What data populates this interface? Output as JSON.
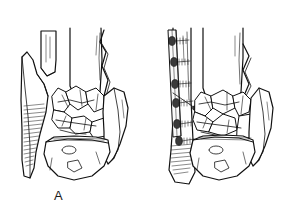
{
  "figure": {
    "background_color": "#ffffff",
    "ink_color": "#111111",
    "width": 286,
    "height": 215,
    "style": "black-and-white medical line drawing",
    "panel_count": 2
  },
  "panels": [
    {
      "id": "panel-a",
      "label": "A",
      "caption": "Comminuted distal tibia and fibula fracture, unfixed",
      "label_position": {
        "x": 54,
        "y": 189
      },
      "features": [
        "tibial-shaft",
        "fibular-shaft-fragment",
        "comminuted-articular-fragments",
        "lateral-malleolus-fragment",
        "medial-malleolus-fragment",
        "talus-dome",
        "shading-hatch-lines"
      ]
    },
    {
      "id": "panel-b",
      "label": "B",
      "caption": "Same fracture after fibular plate and screw fixation",
      "label_position": {
        "x": 160,
        "y": 189
      },
      "features": [
        "fibular-plate",
        "plate-screws",
        "tibial-shaft",
        "comminuted-articular-fragments",
        "lateral-malleolus-fragment",
        "medial-malleolus-fragment",
        "talus-dome",
        "shading-hatch-lines"
      ],
      "hardware": {
        "implant_name": "fibular plate",
        "screw_count": 6,
        "screw_label": "cortical screw"
      }
    }
  ],
  "labels": {
    "a": "A",
    "b": "B"
  }
}
